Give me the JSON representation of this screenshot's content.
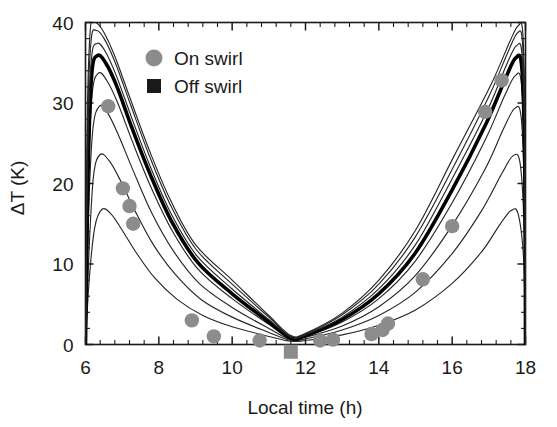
{
  "chart_data": {
    "type": "line",
    "title": "",
    "xlabel": "Local time (h)",
    "ylabel": "ΔT (K)",
    "xlim": [
      6,
      18
    ],
    "ylim": [
      0,
      40
    ],
    "xticks": [
      6,
      8,
      10,
      12,
      14,
      16,
      18
    ],
    "yticks": [
      0,
      10,
      20,
      30,
      40
    ],
    "xtick_labels": [
      "6",
      "8",
      "10",
      "12",
      "14",
      "16",
      "18"
    ],
    "ytick_labels": [
      "0",
      "10",
      "20",
      "30",
      "40"
    ],
    "minor_ticks_per_interval": 4,
    "grid": false,
    "legend_position": "upper-left-inside",
    "legend": [
      {
        "label": "On swirl",
        "marker": "circle",
        "color": "#8c8c8c"
      },
      {
        "label": "Off swirl",
        "marker": "square",
        "color": "#1a1a1a"
      }
    ],
    "series": [
      {
        "name": "model curve 1 (widest, lowest peak)",
        "style": "thin",
        "linewidth": 1.15,
        "color": "#262626",
        "x": [
          6.0,
          6.1,
          6.25,
          6.45,
          6.7,
          7.0,
          7.4,
          7.9,
          8.5,
          9.2,
          10.0,
          11.0,
          11.6,
          12.0,
          13.0,
          14.0,
          15.0,
          16.0,
          16.8,
          17.3,
          17.6,
          17.8,
          17.95,
          18.0
        ],
        "y": [
          0.0,
          8.0,
          14.5,
          16.8,
          16.2,
          14.2,
          11.3,
          8.2,
          5.6,
          3.6,
          2.2,
          1.0,
          0.4,
          0.5,
          1.2,
          2.4,
          4.3,
          7.6,
          11.5,
          14.9,
          16.6,
          16.2,
          10.5,
          0.0
        ]
      },
      {
        "name": "model curve 2",
        "style": "thin",
        "linewidth": 1.15,
        "color": "#262626",
        "x": [
          6.0,
          6.1,
          6.22,
          6.4,
          6.65,
          6.95,
          7.35,
          7.85,
          8.45,
          9.15,
          10.0,
          11.0,
          11.6,
          12.0,
          13.0,
          14.0,
          15.0,
          16.0,
          16.8,
          17.35,
          17.65,
          17.85,
          17.96,
          18.0
        ],
        "y": [
          0.0,
          12.0,
          21.0,
          23.6,
          22.8,
          20.4,
          16.6,
          12.4,
          8.7,
          5.6,
          3.4,
          1.5,
          0.5,
          0.7,
          1.8,
          3.6,
          6.5,
          11.3,
          16.6,
          21.2,
          23.4,
          22.6,
          14.6,
          0.0
        ]
      },
      {
        "name": "model curve 3",
        "style": "thin",
        "linewidth": 1.15,
        "color": "#262626",
        "x": [
          6.0,
          6.08,
          6.2,
          6.38,
          6.6,
          6.9,
          7.3,
          7.8,
          8.4,
          9.1,
          10.0,
          11.0,
          11.6,
          12.0,
          13.0,
          14.0,
          15.0,
          16.0,
          16.9,
          17.4,
          17.7,
          17.88,
          17.97,
          18.0
        ],
        "y": [
          0.0,
          16.0,
          26.7,
          29.6,
          28.8,
          26.0,
          21.6,
          16.4,
          11.6,
          7.6,
          4.6,
          2.0,
          0.6,
          0.9,
          2.3,
          4.7,
          8.6,
          14.8,
          21.8,
          26.8,
          29.3,
          28.3,
          18.4,
          0.0
        ]
      },
      {
        "name": "model curve 4",
        "style": "thin",
        "linewidth": 1.15,
        "color": "#262626",
        "x": [
          6.0,
          6.07,
          6.18,
          6.35,
          6.58,
          6.88,
          7.28,
          7.78,
          8.38,
          9.08,
          10.0,
          11.0,
          11.6,
          12.0,
          13.0,
          14.0,
          15.0,
          16.0,
          16.9,
          17.42,
          17.72,
          17.89,
          17.975,
          18.0
        ],
        "y": [
          0.0,
          19.5,
          31.0,
          33.7,
          32.8,
          30.0,
          25.2,
          19.6,
          14.0,
          9.3,
          5.7,
          2.5,
          0.7,
          1.0,
          2.8,
          5.7,
          10.4,
          17.6,
          25.4,
          30.8,
          33.4,
          32.3,
          21.0,
          0.0
        ]
      },
      {
        "name": "model curve 5 (bold reference)",
        "style": "thick",
        "linewidth": 3.6,
        "color": "#000000",
        "x": [
          6.0,
          6.07,
          6.17,
          6.33,
          6.56,
          6.86,
          7.26,
          7.76,
          8.36,
          9.06,
          10.0,
          11.0,
          11.6,
          12.0,
          13.0,
          14.0,
          15.0,
          16.0,
          16.92,
          17.44,
          17.73,
          17.9,
          17.98,
          18.0
        ],
        "y": [
          0.0,
          21.5,
          33.6,
          35.9,
          34.9,
          32.0,
          27.0,
          21.2,
          15.2,
          10.2,
          6.3,
          2.8,
          0.8,
          1.1,
          3.1,
          6.3,
          11.4,
          19.2,
          27.4,
          32.9,
          35.6,
          34.4,
          22.4,
          0.0
        ]
      },
      {
        "name": "model curve 6",
        "style": "thin",
        "linewidth": 1.15,
        "color": "#262626",
        "x": [
          6.0,
          6.06,
          6.16,
          6.32,
          6.54,
          6.84,
          7.24,
          7.74,
          8.34,
          9.04,
          10.0,
          11.0,
          11.6,
          12.0,
          13.0,
          14.0,
          15.0,
          16.0,
          16.95,
          17.46,
          17.75,
          17.91,
          17.98,
          18.0
        ],
        "y": [
          0.0,
          23.5,
          35.4,
          37.4,
          36.4,
          33.4,
          28.4,
          22.4,
          16.2,
          11.0,
          6.9,
          3.1,
          0.9,
          1.2,
          3.4,
          6.9,
          12.4,
          20.6,
          29.0,
          34.5,
          37.1,
          35.8,
          23.4,
          0.0
        ]
      },
      {
        "name": "model curve 7",
        "style": "thin",
        "linewidth": 1.15,
        "color": "#262626",
        "x": [
          6.0,
          6.05,
          6.15,
          6.3,
          6.52,
          6.82,
          7.22,
          7.72,
          8.32,
          9.02,
          10.0,
          11.0,
          11.6,
          12.0,
          13.0,
          14.0,
          15.0,
          16.05,
          17.0,
          17.5,
          17.78,
          17.92,
          17.985,
          18.0
        ],
        "y": [
          0.0,
          26.0,
          37.6,
          39.0,
          37.9,
          34.9,
          29.9,
          23.7,
          17.3,
          11.8,
          7.5,
          3.4,
          1.0,
          1.3,
          3.7,
          7.5,
          13.4,
          22.2,
          30.8,
          36.1,
          38.7,
          37.3,
          24.5,
          0.0
        ]
      },
      {
        "name": "model curve 8 (narrowest, highest peak)",
        "style": "thin",
        "linewidth": 1.15,
        "color": "#262626",
        "x": [
          6.0,
          6.05,
          6.14,
          6.28,
          6.5,
          6.8,
          7.2,
          7.7,
          8.3,
          9.0,
          10.0,
          11.0,
          11.6,
          12.0,
          13.0,
          14.0,
          15.0,
          16.05,
          17.05,
          17.55,
          17.8,
          17.93,
          17.99,
          18.0
        ],
        "y": [
          0.0,
          28.5,
          39.6,
          40.0,
          38.8,
          35.8,
          30.8,
          24.6,
          18.1,
          12.4,
          8.0,
          3.6,
          1.1,
          1.4,
          3.9,
          8.0,
          14.2,
          23.4,
          32.2,
          37.4,
          39.6,
          38.4,
          25.2,
          0.0
        ]
      }
    ],
    "points_on_swirl": [
      {
        "x": 6.62,
        "y": 29.6
      },
      {
        "x": 7.02,
        "y": 19.4
      },
      {
        "x": 7.2,
        "y": 17.2
      },
      {
        "x": 7.3,
        "y": 15.0
      },
      {
        "x": 8.9,
        "y": 3.0
      },
      {
        "x": 9.5,
        "y": 1.0
      },
      {
        "x": 10.75,
        "y": 0.5
      },
      {
        "x": 12.4,
        "y": 0.5
      },
      {
        "x": 12.75,
        "y": 0.6
      },
      {
        "x": 13.8,
        "y": 1.3
      },
      {
        "x": 14.1,
        "y": 1.8
      },
      {
        "x": 14.25,
        "y": 2.6
      },
      {
        "x": 15.2,
        "y": 8.1
      },
      {
        "x": 16.0,
        "y": 14.7
      },
      {
        "x": 16.9,
        "y": 28.9
      },
      {
        "x": 17.35,
        "y": 32.8
      }
    ],
    "points_off_swirl": [
      {
        "x": 11.6,
        "y": -0.9
      }
    ]
  }
}
